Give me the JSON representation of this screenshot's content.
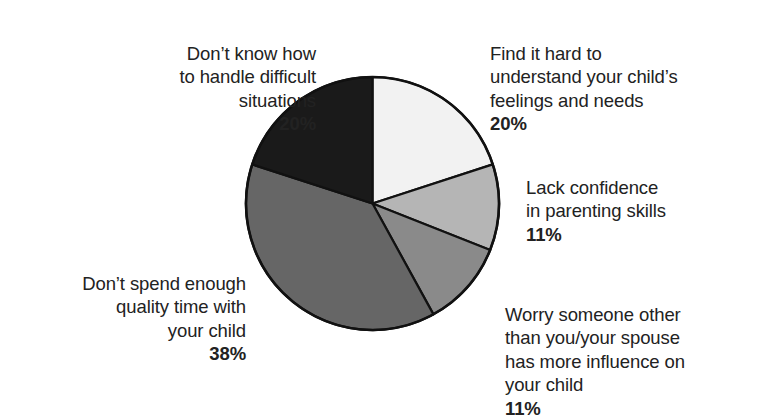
{
  "chart_data": {
    "type": "pie",
    "title": "",
    "subtitle": "",
    "xlabel": "",
    "ylabel": "",
    "legend_position": "callout-labels",
    "grid": false,
    "value_unit": "percent",
    "start_angle_deg": 0,
    "direction": "clockwise",
    "categories": [
      "Find it hard to understand your child's feelings and needs",
      "Lack confidence in parenting skills",
      "Worry someone other than you/your spouse has more influence on your child",
      "Don't spend enough quality time with your child",
      "Don't know how to handle difficult situations"
    ],
    "values": [
      20,
      11,
      11,
      38,
      20
    ],
    "colors": [
      "#f2f2f2",
      "#b5b5b5",
      "#8a8a8a",
      "#666666",
      "#1a1a1a"
    ],
    "slices": [
      {
        "id": "understand-feelings",
        "label": "Find it hard to\nunderstand your child’s\nfeelings and needs",
        "value": 20,
        "value_label": "20%",
        "color": "#f2f2f2",
        "start_deg": 0,
        "end_deg": 72
      },
      {
        "id": "lack-confidence",
        "label": "Lack confidence\nin parenting skills",
        "value": 11,
        "value_label": "11%",
        "color": "#b5b5b5",
        "start_deg": 72,
        "end_deg": 111.6
      },
      {
        "id": "worry-influence",
        "label": "Worry someone other\nthan you/your spouse\nhas more influence on\nyour child",
        "value": 11,
        "value_label": "11%",
        "color": "#8a8a8a",
        "start_deg": 111.6,
        "end_deg": 151.2
      },
      {
        "id": "quality-time",
        "label": "Don’t spend enough\nquality time with\nyour child",
        "value": 38,
        "value_label": "38%",
        "color": "#666666",
        "start_deg": 151.2,
        "end_deg": 288
      },
      {
        "id": "difficult-situations",
        "label": "Don’t know how\nto handle difficult\nsituations",
        "value": 20,
        "value_label": "20%",
        "color": "#1a1a1a",
        "start_deg": 288,
        "end_deg": 360
      }
    ]
  },
  "labels": {
    "difficult_situations": {
      "text": "Don’t know how\nto handle difficult\nsituations",
      "percent": "20%"
    },
    "understand_feelings": {
      "text": "Find it hard to\nunderstand your child’s\nfeelings and needs",
      "percent": "20%"
    },
    "lack_confidence": {
      "text": "Lack confidence\nin parenting skills",
      "percent": "11%"
    },
    "worry_influence": {
      "text": "Worry someone other\nthan you/your spouse\nhas more influence on\nyour child",
      "percent": "11%"
    },
    "quality_time": {
      "text": "Don’t spend enough\nquality time with\nyour child",
      "percent": "38%"
    }
  }
}
